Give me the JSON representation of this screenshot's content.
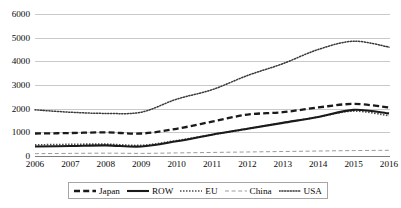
{
  "chart_data": {
    "type": "line",
    "title": "",
    "subtitle": "",
    "xlabel": "",
    "ylabel": "",
    "categories": [
      "2006",
      "2007",
      "2008",
      "2009",
      "2010",
      "2011",
      "2012",
      "2013",
      "2014",
      "2015",
      "2016"
    ],
    "x": [
      2006,
      2007,
      2008,
      2009,
      2010,
      2011,
      2012,
      2013,
      2014,
      2015,
      2016
    ],
    "ylim": [
      0,
      6000
    ],
    "yticks": [
      0,
      1000,
      2000,
      3000,
      4000,
      5000,
      6000
    ],
    "ytick_labels": [
      "0",
      "1000",
      "2000",
      "3000",
      "4000",
      "5000",
      "6000"
    ],
    "grid": true,
    "grid_axis": "y",
    "legend_position": "bottom",
    "series": [
      {
        "name": "Japan",
        "style": "dashed-thick",
        "color": "#1a1a1a",
        "values": [
          950,
          970,
          1000,
          950,
          1150,
          1450,
          1750,
          1850,
          2050,
          2200,
          2050
        ]
      },
      {
        "name": "ROW",
        "style": "solid-thick",
        "color": "#1a1a1a",
        "values": [
          400,
          420,
          450,
          400,
          620,
          900,
          1150,
          1400,
          1650,
          1950,
          1800
        ]
      },
      {
        "name": "EU",
        "style": "dotted-medium",
        "color": "#4d4d4d",
        "values": [
          470,
          490,
          500,
          450,
          650,
          900,
          1150,
          1400,
          1650,
          1900,
          1700
        ]
      },
      {
        "name": "China",
        "style": "long-dash-thin",
        "color": "#9a9a9a",
        "values": [
          100,
          110,
          120,
          110,
          130,
          150,
          170,
          190,
          210,
          230,
          240
        ]
      },
      {
        "name": "USA",
        "style": "dotted-fine",
        "color": "#3a3a3a",
        "values": [
          1950,
          1850,
          1800,
          1850,
          2400,
          2800,
          3400,
          3900,
          4500,
          4850,
          4600
        ]
      }
    ]
  },
  "legend": {
    "entries": [
      {
        "label": "Japan"
      },
      {
        "label": "ROW"
      },
      {
        "label": "EU"
      },
      {
        "label": "China"
      },
      {
        "label": "USA"
      }
    ]
  },
  "colors": {
    "gridline": "#c9c9c9",
    "axis": "#7d7d7d",
    "text": "#0a0a0a",
    "background": "#ffffff",
    "legend_border": "#a6a6a6"
  }
}
